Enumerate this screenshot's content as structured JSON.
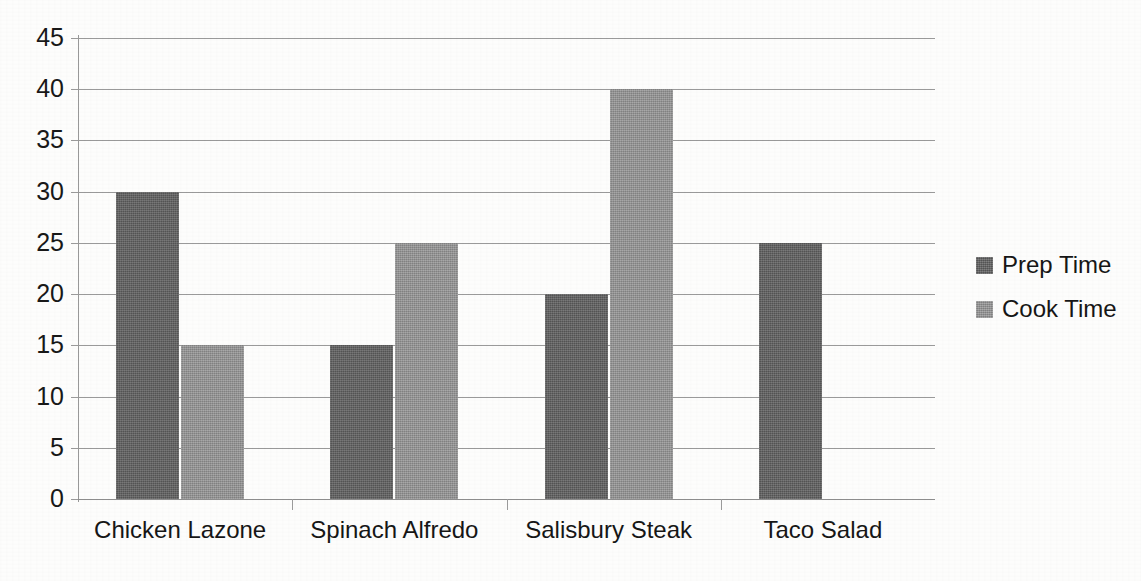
{
  "chart_data": {
    "type": "bar",
    "title": "",
    "subtitle": "",
    "xlabel": "",
    "ylabel": "",
    "categories": [
      "Chicken Lazone",
      "Spinach Alfredo",
      "Salisbury Steak",
      "Taco Salad"
    ],
    "series": [
      {
        "name": "Prep Time",
        "color": "#5d5d5d",
        "values": [
          30,
          15,
          20,
          25
        ]
      },
      {
        "name": "Cook Time",
        "color": "#909090",
        "values": [
          15,
          25,
          40,
          null
        ]
      }
    ],
    "ylim": [
      0,
      45
    ],
    "ytick_labels": [
      "45",
      "40",
      "35",
      "30",
      "25",
      "20",
      "15",
      "10",
      "5",
      "0"
    ],
    "ytick_values": [
      45,
      40,
      35,
      30,
      25,
      20,
      15,
      10,
      5,
      0
    ],
    "ytick_step": 5,
    "grid": true,
    "grid_axis": "y",
    "legend": [
      "Prep Time",
      "Cook Time"
    ],
    "legend_position": "right",
    "background_color": "#fdfdfc",
    "gridline_color": "#9a9a9a",
    "axis_color": "#9a9a9a",
    "text_color": "#161616"
  },
  "legend": {
    "items": [
      {
        "label": "Prep Time",
        "swatch": "prep-time-swatch"
      },
      {
        "label": "Cook Time",
        "swatch": "cook-time-swatch"
      }
    ]
  }
}
